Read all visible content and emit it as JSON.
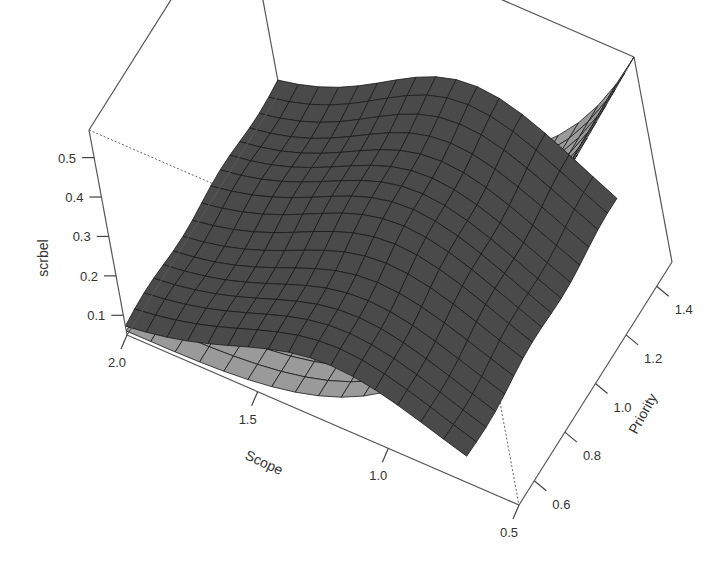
{
  "chart_data": {
    "type": "surface3d",
    "title": "",
    "zlabel": "scrbel",
    "xlabel": "Scope",
    "ylabel": "Priority",
    "x_ticks": [
      "2.0",
      "1.5",
      "1.0",
      "0.5"
    ],
    "y_ticks": [
      "0.6",
      "0.8",
      "1.0",
      "1.2",
      "1.4"
    ],
    "z_ticks": [
      "0.1",
      "0.2",
      "0.3",
      "0.4",
      "0.5"
    ],
    "xlim": [
      0.5,
      2.0
    ],
    "ylim": [
      0.5,
      1.5
    ],
    "zlim": [
      0.05,
      0.57
    ],
    "grid_size": 16,
    "colors": {
      "light_face": "#9a9a9a",
      "dark_face": "#4a4a4a",
      "mesh": "#1a1a1a",
      "box": "#555555"
    }
  }
}
